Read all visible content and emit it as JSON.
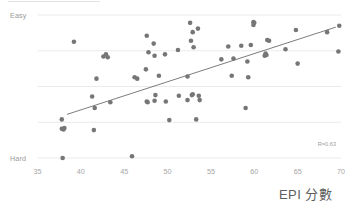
{
  "chart_data": {
    "type": "scatter",
    "title": "",
    "xlabel": "EPI 分數",
    "ylabel": "",
    "xlim": [
      35,
      70
    ],
    "ylim": [
      0,
      4
    ],
    "grid": true,
    "legend": false,
    "xticks": [
      "35",
      "40",
      "45",
      "50",
      "55",
      "60",
      "65",
      "70"
    ],
    "xtick_values": [
      35,
      40,
      45,
      50,
      55,
      60,
      65,
      70
    ],
    "ytick_labels": [
      "Hard",
      "",
      "",
      "",
      "Easy"
    ],
    "ytick_values": [
      0,
      1,
      2,
      3,
      4
    ],
    "y_axis_top_label": "Easy",
    "y_axis_bottom_label": "Hard",
    "annotations": [
      {
        "text": "R=0.63",
        "position": "bottom-right"
      }
    ],
    "correlation": 0.63,
    "series": [
      {
        "name": "observations",
        "color": "#767676",
        "marker": "circle",
        "points": [
          [
            37.8,
            1.08
          ],
          [
            37.8,
            0.82
          ],
          [
            38.0,
            0.8
          ],
          [
            38.1,
            0.84
          ],
          [
            37.9,
            0.0
          ],
          [
            39.2,
            3.25
          ],
          [
            41.3,
            1.72
          ],
          [
            41.5,
            0.78
          ],
          [
            41.6,
            1.4
          ],
          [
            41.8,
            2.22
          ],
          [
            42.6,
            2.84
          ],
          [
            42.9,
            2.9
          ],
          [
            43.1,
            2.82
          ],
          [
            43.4,
            1.56
          ],
          [
            45.9,
            0.05
          ],
          [
            46.2,
            2.26
          ],
          [
            46.5,
            2.22
          ],
          [
            47.5,
            2.48
          ],
          [
            47.6,
            1.58
          ],
          [
            47.7,
            1.56
          ],
          [
            47.6,
            3.42
          ],
          [
            47.8,
            2.96
          ],
          [
            48.4,
            3.2
          ],
          [
            48.5,
            2.86
          ],
          [
            48.6,
            1.76
          ],
          [
            48.5,
            1.6
          ],
          [
            49.0,
            2.3
          ],
          [
            49.7,
            2.9
          ],
          [
            49.8,
            1.58
          ],
          [
            50.2,
            1.06
          ],
          [
            51.3,
            1.74
          ],
          [
            51.2,
            3.02
          ],
          [
            52.3,
            2.28
          ],
          [
            52.3,
            1.62
          ],
          [
            52.6,
            3.78
          ],
          [
            52.7,
            3.28
          ],
          [
            52.8,
            1.76
          ],
          [
            52.9,
            1.78
          ],
          [
            52.9,
            3.52
          ],
          [
            53.0,
            3.1
          ],
          [
            53.3,
            1.08
          ],
          [
            53.5,
            3.62
          ],
          [
            53.6,
            1.74
          ],
          [
            53.7,
            1.62
          ],
          [
            56.2,
            2.76
          ],
          [
            57.0,
            3.12
          ],
          [
            57.4,
            2.3
          ],
          [
            57.6,
            2.78
          ],
          [
            58.5,
            3.14
          ],
          [
            59.0,
            1.4
          ],
          [
            59.2,
            2.7
          ],
          [
            59.3,
            2.26
          ],
          [
            59.6,
            3.16
          ],
          [
            59.9,
            3.8
          ],
          [
            59.9,
            3.72
          ],
          [
            60.0,
            3.78
          ],
          [
            61.2,
            2.86
          ],
          [
            61.3,
            2.92
          ],
          [
            61.4,
            2.88
          ],
          [
            61.5,
            3.3
          ],
          [
            61.7,
            3.28
          ],
          [
            63.6,
            3.04
          ],
          [
            64.8,
            3.58
          ],
          [
            65.0,
            2.64
          ],
          [
            68.4,
            3.52
          ],
          [
            69.7,
            2.98
          ],
          [
            69.8,
            3.7
          ]
        ]
      }
    ],
    "trendline": {
      "visible": true,
      "color": "#5a5a5a",
      "x_start": 38.4,
      "y_start": 1.22,
      "x_end": 69.4,
      "y_end": 3.66
    }
  }
}
